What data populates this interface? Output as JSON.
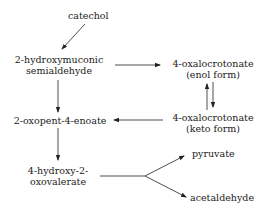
{
  "diagram": {
    "type": "metabolic pathway",
    "nodes": {
      "catechol": "catechol",
      "hms_1": "2-hydroxymuconic",
      "hms_2": "semialdehyde",
      "oxc_enol_1": "4-oxalocrotonate",
      "oxc_enol_2": "(enol form)",
      "oxc_keto_1": "4-oxalocrotonate",
      "oxc_keto_2": "(keto form)",
      "oxopentenoate": "2-oxopent-4-enoate",
      "hov_1": "4-hydroxy-2-",
      "hov_2": "oxovalerate",
      "pyruvate": "pyruvate",
      "acetaldehyde": "acetaldehyde"
    },
    "edges": [
      {
        "from": "catechol",
        "to": "2-hydroxymuconic semialdehyde"
      },
      {
        "from": "2-hydroxymuconic semialdehyde",
        "to": "4-oxalocrotonate (enol form)"
      },
      {
        "from": "2-hydroxymuconic semialdehyde",
        "to": "2-oxopent-4-enoate"
      },
      {
        "from": "4-oxalocrotonate (enol form)",
        "to": "4-oxalocrotonate (keto form)",
        "reversible": true
      },
      {
        "from": "4-oxalocrotonate (keto form)",
        "to": "2-oxopent-4-enoate"
      },
      {
        "from": "2-oxopent-4-enoate",
        "to": "4-hydroxy-2-oxovalerate"
      },
      {
        "from": "4-hydroxy-2-oxovalerate",
        "to": "pyruvate"
      },
      {
        "from": "4-hydroxy-2-oxovalerate",
        "to": "acetaldehyde"
      }
    ]
  }
}
